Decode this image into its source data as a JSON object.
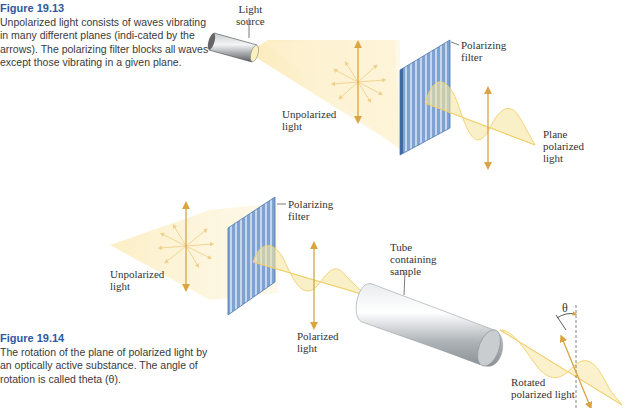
{
  "figure_13": {
    "number": "Figure 19.13",
    "caption": "Unpolarized light consists of waves vibrating in many different planes (indi-cated by the arrows). The polarizing filter blocks all waves except those vibrating in a given plane.",
    "labels": {
      "light_source": "Light\nsource",
      "polarizing_filter": "Polarizing\nfilter",
      "unpolarized_light": "Unpolarized\nlight",
      "plane_polarized_light": "Plane\npolarized\nlight"
    }
  },
  "figure_14": {
    "number": "Figure 19.14",
    "caption": "The rotation of the plane of polarized light by an optically active substance. The angle of rotation is called theta (θ).",
    "labels": {
      "polarizing_filter": "Polarizing\nfilter",
      "unpolarized_light": "Unpolarized\nlight",
      "polarized_light": "Polarized\nlight",
      "tube": "Tube\ncontaining\nsample",
      "theta": "θ",
      "rotated_light": "Rotated\npolarized light"
    }
  },
  "colors": {
    "figure_label": "#2c5aa0",
    "filter_blue": "#6f95c8",
    "light_yellow": "#fbefc4",
    "arrow_gold": "#d9a441",
    "wave_yellow": "#f4d77a"
  }
}
